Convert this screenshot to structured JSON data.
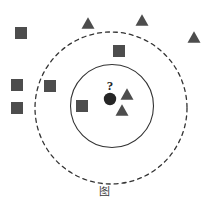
{
  "figure": {
    "title_caption": "图",
    "caption_visible_note": "",
    "background_color": "#ffffff",
    "width": 210,
    "height": 197
  },
  "colors": {
    "shape_fill": "#4d4d4d",
    "query_point_fill": "#262626",
    "circle_stroke": "#333333",
    "dashed_circle_stroke": "#333333",
    "caption_text": "#3a3a3a"
  },
  "query_point": {
    "label": "?",
    "label_x": 110,
    "label_y": 86,
    "cx": 110,
    "cy": 99,
    "r": 6.2,
    "name": "unknown-sample"
  },
  "boundaries": [
    {
      "name": "inner-neighborhood-circle",
      "style": "solid",
      "cx": 112,
      "cy": 106,
      "r": 41.5,
      "stroke_width": 1.1
    },
    {
      "name": "outer-neighborhood-circle",
      "style": "dashed",
      "cx": 111,
      "cy": 108,
      "r": 76,
      "stroke_width": 1.3,
      "dash_pattern": "4 4"
    }
  ],
  "squares": [
    {
      "id": "square-1",
      "cx": 21,
      "cy": 33,
      "size": 12
    },
    {
      "id": "square-2",
      "cx": 17,
      "cy": 85,
      "size": 12
    },
    {
      "id": "square-3",
      "cx": 50,
      "cy": 86,
      "size": 12
    },
    {
      "id": "square-4",
      "cx": 17,
      "cy": 108,
      "size": 12
    },
    {
      "id": "square-5",
      "cx": 119,
      "cy": 51,
      "size": 12
    },
    {
      "id": "square-6",
      "cx": 82,
      "cy": 106,
      "size": 12
    }
  ],
  "triangles": [
    {
      "id": "triangle-1",
      "cx": 88,
      "cy": 23,
      "size": 13
    },
    {
      "id": "triangle-2",
      "cx": 142,
      "cy": 20,
      "size": 13
    },
    {
      "id": "triangle-3",
      "cx": 194,
      "cy": 37,
      "size": 13
    },
    {
      "id": "triangle-4",
      "cx": 127,
      "cy": 94,
      "size": 13
    },
    {
      "id": "triangle-5",
      "cx": 122,
      "cy": 110,
      "size": 13
    }
  ],
  "chart_data": {
    "type": "scatter",
    "title": "",
    "xlabel": "",
    "ylabel": "",
    "xlim": [
      0,
      210
    ],
    "ylim": [
      0,
      197
    ],
    "grid": false,
    "legend": null,
    "series": [
      {
        "name": "class-square",
        "marker": "square",
        "color": "#4d4d4d",
        "points": [
          {
            "x": 21,
            "y": 33
          },
          {
            "x": 17,
            "y": 85
          },
          {
            "x": 50,
            "y": 86
          },
          {
            "x": 17,
            "y": 108
          },
          {
            "x": 119,
            "y": 51
          },
          {
            "x": 82,
            "y": 106
          }
        ]
      },
      {
        "name": "class-triangle",
        "marker": "triangle",
        "color": "#4d4d4d",
        "points": [
          {
            "x": 88,
            "y": 23
          },
          {
            "x": 142,
            "y": 20
          },
          {
            "x": 194,
            "y": 37
          },
          {
            "x": 127,
            "y": 94
          },
          {
            "x": 122,
            "y": 110
          }
        ]
      },
      {
        "name": "query-point",
        "marker": "circle",
        "color": "#262626",
        "points": [
          {
            "x": 110,
            "y": 99,
            "label": "?"
          }
        ]
      }
    ],
    "annotations": [
      {
        "text": "?",
        "x": 110,
        "y": 86
      }
    ],
    "shapes": [
      {
        "type": "circle",
        "style": "solid",
        "cx": 112,
        "cy": 106,
        "r": 41.5
      },
      {
        "type": "circle",
        "style": "dashed",
        "cx": 111,
        "cy": 108,
        "r": 76
      }
    ]
  },
  "caption": {
    "text": "图",
    "cut_off": true,
    "top": 186,
    "font_size": 11
  }
}
